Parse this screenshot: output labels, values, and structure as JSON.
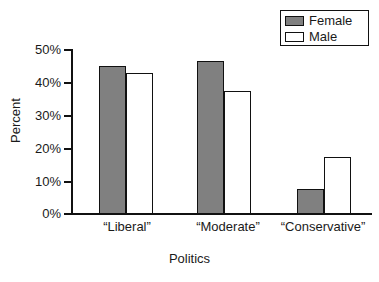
{
  "chart_data": {
    "type": "bar",
    "title": "",
    "xlabel": "Politics",
    "ylabel": "Percent",
    "categories": [
      "“Liberal”",
      "“Moderate”",
      "“Conservative”"
    ],
    "series": [
      {
        "name": "Female",
        "color": "#808080",
        "values": [
          45,
          46.5,
          7.5
        ]
      },
      {
        "name": "Male",
        "color": "#ffffff",
        "values": [
          43,
          37.5,
          17.5
        ]
      }
    ],
    "ylim": [
      0,
      50
    ],
    "ytick_values": [
      50,
      40,
      30,
      20,
      10,
      0
    ],
    "ytick_labels": [
      "50%",
      "40%",
      "30%",
      "20%",
      "10%",
      "0%"
    ],
    "grid": false,
    "legend_position": "top-right",
    "legend_entries": [
      "Female",
      "Male"
    ]
  },
  "axis": {
    "y_title": "Percent",
    "x_title": "Politics"
  },
  "legend": {
    "items": [
      {
        "label": "Female"
      },
      {
        "label": "Male"
      }
    ]
  }
}
